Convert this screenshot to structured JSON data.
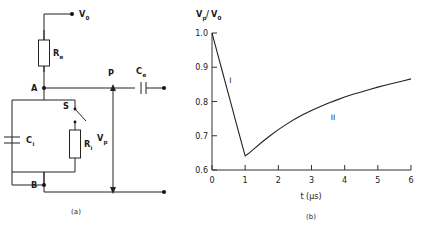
{
  "figure": {
    "panel_a": {
      "caption": "(a)",
      "title": "equivalent circuit",
      "terminals": [
        {
          "name": "v0-terminal",
          "label": "V",
          "sub": "0"
        },
        {
          "name": "node-a",
          "label": "A"
        },
        {
          "name": "node-b",
          "label": "B"
        },
        {
          "name": "point-p",
          "label": "P"
        }
      ],
      "components": [
        {
          "name": "external-resistor",
          "label": "R",
          "sub": "e"
        },
        {
          "name": "internal-capacitor",
          "label": "C",
          "sub": "i"
        },
        {
          "name": "internal-resistor",
          "label": "R",
          "sub": "i"
        },
        {
          "name": "external-capacitor",
          "label": "C",
          "sub": "e"
        },
        {
          "name": "switch",
          "label": "S"
        }
      ],
      "measurement": {
        "name": "vp-arrow",
        "label": "V",
        "sub": "p"
      }
    },
    "panel_b": {
      "caption": "(b)",
      "branch_labels": [
        {
          "label": "I",
          "x": 0.55,
          "y": 0.855
        },
        {
          "label": "II",
          "x": 3.65,
          "y": 0.745
        }
      ]
    }
  },
  "chart_data": {
    "type": "line",
    "title": "",
    "xlabel": "t (µs)",
    "ylabel": "Vp/V0",
    "ylabel_parts": {
      "main": "V",
      "sub1": "p",
      "slash": "/",
      "main2": "V",
      "sub2": "0"
    },
    "xlim": [
      0,
      6
    ],
    "ylim": [
      0.6,
      1.0
    ],
    "xticks": [
      0,
      1,
      2,
      3,
      4,
      5,
      6
    ],
    "xtick_labels": [
      "0",
      "1",
      "2",
      "3",
      "4",
      "5",
      "6"
    ],
    "yticks": [
      0.6,
      0.7,
      0.8,
      0.9,
      1.0
    ],
    "ytick_labels": [
      "0.6",
      "0.7",
      "0.8",
      "0.9",
      "1.0"
    ],
    "grid": false,
    "legend": false,
    "series": [
      {
        "name": "Vp/V0",
        "x": [
          0.0,
          0.1,
          0.2,
          0.3,
          0.4,
          0.5,
          0.6,
          0.7,
          0.8,
          0.9,
          1.0,
          1.1,
          1.25,
          1.5,
          1.75,
          2.0,
          2.25,
          2.5,
          2.75,
          3.0,
          3.25,
          3.5,
          3.75,
          4.0,
          4.25,
          4.5,
          4.75,
          5.0,
          5.25,
          5.5,
          5.75,
          6.0
        ],
        "y": [
          1.0,
          0.964,
          0.928,
          0.892,
          0.856,
          0.82,
          0.784,
          0.748,
          0.712,
          0.676,
          0.641,
          0.648,
          0.66,
          0.681,
          0.7,
          0.718,
          0.734,
          0.749,
          0.762,
          0.774,
          0.785,
          0.795,
          0.804,
          0.813,
          0.821,
          0.828,
          0.835,
          0.842,
          0.848,
          0.854,
          0.86,
          0.866
        ]
      }
    ],
    "annotations": [
      {
        "text": "I",
        "x": 0.55,
        "y": 0.855
      },
      {
        "text": "II",
        "x": 3.65,
        "y": 0.745
      }
    ]
  }
}
